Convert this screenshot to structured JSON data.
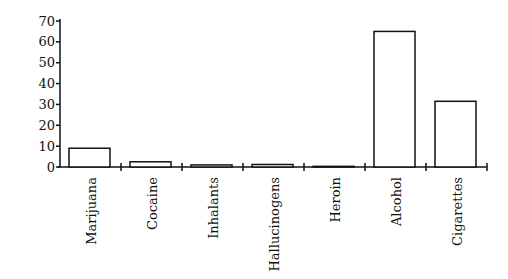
{
  "chart_data": {
    "type": "bar",
    "title": "",
    "xlabel": "",
    "ylabel": "Percent of Total",
    "ylim": [
      0,
      70
    ],
    "yticks": [
      0,
      10,
      20,
      30,
      40,
      50,
      60,
      70
    ],
    "grid": false,
    "legend": null,
    "categories": [
      "Marijuana",
      "Cocaine",
      "Inhalants",
      "Hallucinogens",
      "Heroin",
      "Alcohol",
      "Cigarettes"
    ],
    "values": [
      9,
      2.5,
      1,
      1.2,
      0.3,
      65,
      31.5
    ]
  },
  "style": {
    "bar_fill": "#ffffff",
    "bar_stroke": "#111111",
    "axis_color": "#111111"
  }
}
